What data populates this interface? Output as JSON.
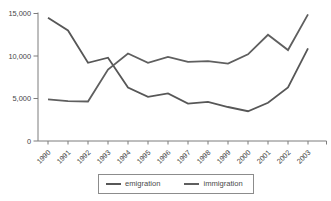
{
  "chart_data": {
    "type": "line",
    "title": "",
    "xlabel": "",
    "ylabel": "",
    "x": [
      1990,
      1991,
      1992,
      1993,
      1994,
      1995,
      1996,
      1997,
      1998,
      1999,
      2000,
      2001,
      2002,
      2003
    ],
    "series": [
      {
        "name": "emigration",
        "color": "#575757",
        "values": [
          14500,
          13000,
          9200,
          9800,
          6300,
          5200,
          5600,
          4400,
          4600,
          4000,
          3500,
          4500,
          6300,
          10900
        ]
      },
      {
        "name": "immigration",
        "color": "#5f5f5f",
        "values": [
          4900,
          4700,
          4650,
          8400,
          10300,
          9200,
          9900,
          9300,
          9400,
          9100,
          10200,
          12500,
          10700,
          14900
        ]
      }
    ],
    "ylim": [
      0,
      15000
    ],
    "yticks": [
      0,
      5000,
      10000,
      15000
    ],
    "ytick_labels": [
      "0",
      "5,000",
      "10,000",
      "15,000"
    ],
    "grid": false,
    "legend_position": "bottom",
    "axis_color": "#7d7d7d",
    "label_color": "#464646",
    "line_width": 1.8
  }
}
